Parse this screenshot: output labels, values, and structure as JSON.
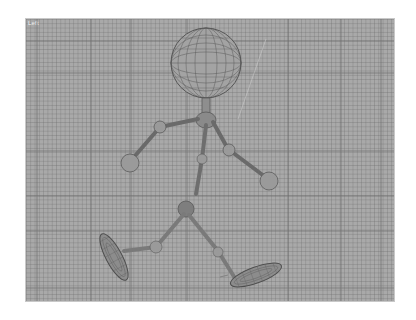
{
  "viewport": {
    "label": "Left",
    "background_color": "#a9a9a9",
    "grid": {
      "minor_color": "#8f8f8f",
      "major_color": "#5e5e5e",
      "major_vertical_x": [
        11,
        65,
        105,
        161,
        262,
        315,
        355
      ],
      "major_horizontal_y": [
        22,
        54,
        132,
        177,
        212,
        269
      ]
    }
  },
  "figure": {
    "name": "walking-wireframe-character",
    "wire_color": "#5a5a5a",
    "joint_fill": "#9a9a9a",
    "parts": [
      "head-sphere",
      "neck",
      "torso",
      "left-arm",
      "right-arm",
      "left-hand-ball",
      "right-hand-ball",
      "pelvis",
      "left-leg",
      "right-leg",
      "left-foot",
      "right-foot"
    ]
  }
}
